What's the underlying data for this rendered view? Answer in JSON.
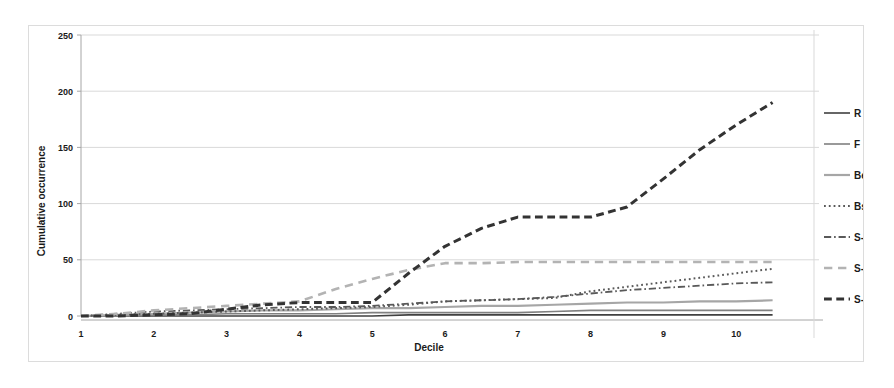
{
  "chart_data": {
    "type": "line",
    "title": "",
    "xlabel": "Decile",
    "ylabel": "Cumulative occurrence",
    "xlim": [
      1,
      11
    ],
    "ylim": [
      0,
      250
    ],
    "xticks": [
      "1",
      "2",
      "3",
      "4",
      "5",
      "6",
      "7",
      "8",
      "9",
      "10"
    ],
    "xtick_values": [
      1,
      2,
      3,
      4,
      5,
      6,
      7,
      8,
      9,
      10
    ],
    "yticks": [
      "0",
      "50",
      "100",
      "150",
      "200",
      "250"
    ],
    "ytick_values": [
      0,
      50,
      100,
      150,
      200,
      250
    ],
    "grid": true,
    "legend_position": "right",
    "x": [
      1,
      1.5,
      2,
      2.5,
      3,
      3.5,
      4,
      4.5,
      5,
      5.5,
      6,
      6.5,
      7,
      7.5,
      8,
      8.5,
      9,
      9.5,
      10,
      10.5
    ],
    "series": [
      {
        "name": "R",
        "label": "R",
        "style": "solid",
        "color": "#404040",
        "width": 1.6,
        "values": [
          0,
          0,
          0,
          0,
          0,
          0,
          0,
          0,
          0,
          1,
          1,
          1,
          1,
          1,
          1,
          1,
          1,
          1,
          1,
          1
        ]
      },
      {
        "name": "F",
        "label": "F",
        "style": "solid",
        "color": "#808080",
        "width": 1.6,
        "values": [
          0,
          0,
          1,
          1,
          2,
          2,
          2,
          2,
          3,
          3,
          3,
          3,
          3,
          4,
          5,
          5,
          5,
          5,
          5,
          5
        ]
      },
      {
        "name": "Be",
        "label": "Be",
        "style": "solid",
        "color": "#a6a6a6",
        "width": 2.2,
        "values": [
          0,
          1,
          2,
          3,
          4,
          5,
          5,
          6,
          7,
          7,
          8,
          9,
          9,
          10,
          11,
          12,
          12,
          13,
          13,
          14
        ]
      },
      {
        "name": "Bs",
        "label": "Bs",
        "style": "dotted",
        "color": "#595959",
        "width": 2.0,
        "values": [
          0,
          1,
          2,
          3,
          4,
          5,
          6,
          7,
          8,
          10,
          13,
          14,
          15,
          16,
          22,
          26,
          30,
          34,
          38,
          42
        ]
      },
      {
        "name": "S-s",
        "label": "S-s",
        "style": "dashdot",
        "color": "#595959",
        "width": 1.8,
        "values": [
          0,
          2,
          4,
          5,
          6,
          7,
          8,
          8,
          9,
          11,
          13,
          14,
          15,
          17,
          20,
          23,
          25,
          27,
          29,
          30
        ]
      },
      {
        "name": "S-b",
        "label": "S-b",
        "style": "dashed",
        "color": "#b3b3b3",
        "width": 2.6,
        "values": [
          0,
          2,
          5,
          7,
          9,
          11,
          13,
          24,
          33,
          41,
          47,
          47,
          48,
          48,
          48,
          48,
          48,
          48,
          48,
          48
        ]
      },
      {
        "name": "S-t",
        "label": "S-t",
        "style": "dashed-dark",
        "color": "#333333",
        "width": 3.0,
        "values": [
          0,
          0,
          1,
          2,
          6,
          10,
          12,
          12,
          12,
          38,
          62,
          78,
          88,
          88,
          88,
          97,
          122,
          148,
          170,
          190
        ]
      }
    ]
  },
  "legend": {
    "items": [
      {
        "label": "R",
        "style": "solid",
        "color": "#404040"
      },
      {
        "label": "F",
        "style": "solid",
        "color": "#808080"
      },
      {
        "label": "Be",
        "style": "solid",
        "color": "#a6a6a6"
      },
      {
        "label": "Bs",
        "style": "dotted",
        "color": "#595959"
      },
      {
        "label": "S-s",
        "style": "dashdot",
        "color": "#595959"
      },
      {
        "label": "S-b",
        "style": "dashed",
        "color": "#b3b3b3"
      },
      {
        "label": "S-t",
        "style": "dashed-dark",
        "color": "#333333"
      }
    ]
  },
  "colors": {
    "background": "#ffffff",
    "frame": "#dcdcdc",
    "gridline": "#d9d9d9",
    "axis": "#a6a6a6",
    "text": "#1a1a1a"
  }
}
